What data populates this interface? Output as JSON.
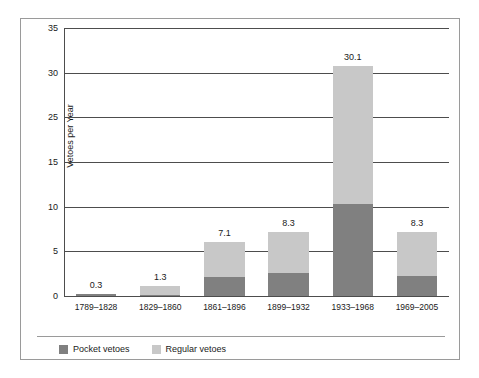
{
  "chart_data": {
    "type": "bar",
    "subtype": "stacked-bar",
    "title": "",
    "xlabel": "",
    "ylabel": "Vetoes per Year",
    "ylim": [
      0,
      35
    ],
    "grid": true,
    "legend_position": "bottom-left",
    "categories": [
      "1789–1828",
      "1829–1860",
      "1861–1896",
      "1899–1932",
      "1933–1968",
      "1969–2005"
    ],
    "ytick_values": [
      35,
      30,
      25,
      20,
      15,
      10,
      5,
      0
    ],
    "ytick_labels": [
      "35",
      "30",
      "25",
      "15",
      "10",
      "5",
      "0"
    ],
    "ytick_label_note": "Original chart omits the 20 label and prints 15 at the fourth gridline; gridlines are evenly spaced at 5-unit intervals.",
    "series": [
      {
        "name": "Pocket vetoes",
        "color": "#808080",
        "values": [
          0.2,
          0.1,
          2.5,
          3.0,
          12.0,
          2.6
        ]
      },
      {
        "name": "Regular vetoes",
        "color": "#c8c8c8",
        "values": [
          0.1,
          1.2,
          4.6,
          5.3,
          18.1,
          5.7
        ]
      }
    ],
    "totals": [
      0.3,
      1.3,
      7.1,
      8.3,
      30.1,
      8.3
    ],
    "total_labels": [
      "0.3",
      "1.3",
      "7.1",
      "8.3",
      "30.1",
      "8.3"
    ]
  },
  "legend": {
    "items": [
      {
        "label": "Pocket vetoes",
        "color": "#808080"
      },
      {
        "label": "Regular vetoes",
        "color": "#c8c8c8"
      }
    ]
  }
}
